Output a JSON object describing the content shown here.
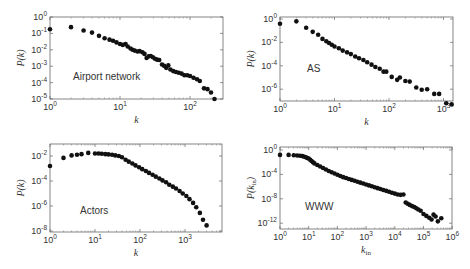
{
  "chart_data": [
    {
      "type": "scatter",
      "title": "Airport network",
      "xlabel": "k",
      "ylabel": "P(k)",
      "xscale": "log",
      "yscale": "log",
      "xlim": [
        1,
        300
      ],
      "ylim": [
        1e-05,
        1
      ],
      "x_ticks": [
        "10^0",
        "10^1",
        "10^2"
      ],
      "y_ticks": [
        "10^0",
        "10^-1",
        "10^-2",
        "10^-3",
        "10^-4",
        "10^-5"
      ],
      "box": {
        "left": 50,
        "top": 17,
        "right": 223,
        "bottom": 99,
        "x_dec": 70,
        "x0": 0,
        "y0": 0,
        "y_dec": 16.4
      },
      "label_pos": [
        73,
        80
      ],
      "log_points": [
        [
          0,
          -0.75
        ],
        [
          0.3,
          -0.62
        ],
        [
          0.48,
          -0.82
        ],
        [
          0.6,
          -0.95
        ],
        [
          0.7,
          -1.15
        ],
        [
          0.78,
          -1.3
        ],
        [
          0.85,
          -1.38
        ],
        [
          0.9,
          -1.45
        ],
        [
          0.95,
          -1.55
        ],
        [
          1.0,
          -1.65
        ],
        [
          1.04,
          -1.7
        ],
        [
          1.08,
          -1.65
        ],
        [
          1.11,
          -1.8
        ],
        [
          1.15,
          -1.92
        ],
        [
          1.18,
          -2.0
        ],
        [
          1.21,
          -2.05
        ],
        [
          1.25,
          -2.1
        ],
        [
          1.28,
          -2.08
        ],
        [
          1.32,
          -2.15
        ],
        [
          1.35,
          -2.25
        ],
        [
          1.38,
          -2.5
        ],
        [
          1.41,
          -2.4
        ],
        [
          1.44,
          -2.38
        ],
        [
          1.47,
          -2.45
        ],
        [
          1.5,
          -2.55
        ],
        [
          1.53,
          -2.6
        ],
        [
          1.56,
          -2.62
        ],
        [
          1.6,
          -2.9
        ],
        [
          1.63,
          -2.98
        ],
        [
          1.66,
          -3.1
        ],
        [
          1.69,
          -2.95
        ],
        [
          1.72,
          -3.2
        ],
        [
          1.76,
          -3.3
        ],
        [
          1.8,
          -3.35
        ],
        [
          1.84,
          -3.4
        ],
        [
          1.88,
          -3.45
        ],
        [
          1.92,
          -3.55
        ],
        [
          1.96,
          -3.55
        ],
        [
          2.0,
          -3.6
        ],
        [
          2.05,
          -3.7
        ],
        [
          2.1,
          -3.8
        ],
        [
          2.14,
          -3.9
        ],
        [
          2.2,
          -4.35
        ],
        [
          2.25,
          -4.4
        ],
        [
          2.3,
          -4.6
        ],
        [
          2.35,
          -5.0
        ]
      ]
    },
    {
      "type": "scatter",
      "title": "AS",
      "xlabel": "k",
      "ylabel": "P(k)",
      "xscale": "log",
      "yscale": "log",
      "xlim": [
        1,
        1500
      ],
      "ylim": [
        1e-07,
        1
      ],
      "x_ticks": [
        "10^0",
        "10^1",
        "10^2",
        "10^3"
      ],
      "y_ticks": [
        "10^0",
        "10^-2",
        "10^-4",
        "10^-6"
      ],
      "box": {
        "left": 280,
        "top": 17,
        "right": 453,
        "bottom": 101,
        "x_dec": 54.5,
        "x0": 0,
        "y0": 0,
        "y_dec": 11.7,
        "y_top": 19
      },
      "label_pos": [
        307,
        72
      ],
      "log_points": [
        [
          0,
          -0.4
        ],
        [
          0.3,
          -0.2
        ],
        [
          0.48,
          -0.75
        ],
        [
          0.6,
          -1.1
        ],
        [
          0.7,
          -1.35
        ],
        [
          0.78,
          -1.7
        ],
        [
          0.85,
          -1.9
        ],
        [
          0.9,
          -2.05
        ],
        [
          0.95,
          -2.2
        ],
        [
          1.0,
          -2.35
        ],
        [
          1.08,
          -2.5
        ],
        [
          1.15,
          -2.7
        ],
        [
          1.23,
          -2.85
        ],
        [
          1.3,
          -3.0
        ],
        [
          1.38,
          -3.2
        ],
        [
          1.45,
          -3.35
        ],
        [
          1.53,
          -3.5
        ],
        [
          1.6,
          -3.7
        ],
        [
          1.68,
          -3.9
        ],
        [
          1.75,
          -4.1
        ],
        [
          1.83,
          -4.25
        ],
        [
          1.9,
          -4.5
        ],
        [
          1.95,
          -4.5
        ],
        [
          2.05,
          -4.95
        ],
        [
          2.15,
          -5.2
        ],
        [
          2.2,
          -5.0
        ],
        [
          2.3,
          -5.3
        ],
        [
          2.38,
          -5.35
        ],
        [
          2.5,
          -5.85
        ],
        [
          2.6,
          -6.05
        ],
        [
          2.7,
          -6.0
        ],
        [
          2.83,
          -6.4
        ],
        [
          2.92,
          -6.4
        ],
        [
          3.05,
          -7.2
        ],
        [
          3.15,
          -7.3
        ]
      ]
    },
    {
      "type": "scatter",
      "title": "Actors",
      "xlabel": "k",
      "ylabel": "P(k)",
      "xscale": "log",
      "yscale": "log",
      "xlim": [
        1,
        7000
      ],
      "ylim": [
        1e-08,
        0.05
      ],
      "x_ticks": [
        "10^0",
        "10^1",
        "10^2",
        "10^3"
      ],
      "y_ticks": [
        "10^-2",
        "10^-4",
        "10^-6",
        "10^-8"
      ],
      "box": {
        "left": 50,
        "top": 144,
        "right": 222,
        "bottom": 232,
        "x_dec": 45,
        "x0": 0,
        "y_ref": -2,
        "y_ref_px": 156,
        "y_dec": 12.5
      },
      "label_pos": [
        80,
        214
      ],
      "log_points": [
        [
          0,
          -2.8
        ],
        [
          0.3,
          -2.15
        ],
        [
          0.48,
          -1.95
        ],
        [
          0.6,
          -1.9
        ],
        [
          0.7,
          -1.85
        ],
        [
          0.85,
          -1.75
        ],
        [
          1.0,
          -1.8
        ],
        [
          1.08,
          -1.8
        ],
        [
          1.15,
          -1.82
        ],
        [
          1.23,
          -1.85
        ],
        [
          1.3,
          -1.87
        ],
        [
          1.38,
          -1.9
        ],
        [
          1.45,
          -1.95
        ],
        [
          1.53,
          -2.0
        ],
        [
          1.6,
          -2.1
        ],
        [
          1.68,
          -2.3
        ],
        [
          1.75,
          -2.45
        ],
        [
          1.83,
          -2.6
        ],
        [
          1.9,
          -2.75
        ],
        [
          1.98,
          -2.9
        ],
        [
          2.05,
          -3.05
        ],
        [
          2.13,
          -3.2
        ],
        [
          2.2,
          -3.35
        ],
        [
          2.28,
          -3.5
        ],
        [
          2.35,
          -3.65
        ],
        [
          2.43,
          -3.8
        ],
        [
          2.5,
          -3.95
        ],
        [
          2.58,
          -4.1
        ],
        [
          2.65,
          -4.3
        ],
        [
          2.73,
          -4.45
        ],
        [
          2.8,
          -4.6
        ],
        [
          2.88,
          -4.8
        ],
        [
          2.95,
          -5.0
        ],
        [
          3.03,
          -5.2
        ],
        [
          3.1,
          -5.45
        ],
        [
          3.18,
          -5.75
        ],
        [
          3.25,
          -6.1
        ],
        [
          3.33,
          -6.55
        ],
        [
          3.4,
          -7.1
        ],
        [
          3.48,
          -7.55
        ]
      ]
    },
    {
      "type": "scatter",
      "title": "WWW",
      "xlabel": "k_in",
      "ylabel": "P(k_in)",
      "xscale": "log",
      "yscale": "log",
      "xlim": [
        1,
        1000000.0
      ],
      "ylim": [
        1e-13,
        1
      ],
      "x_ticks": [
        "10^0",
        "10^1",
        "10^2",
        "10^3",
        "10^4",
        "10^5",
        "10^6"
      ],
      "y_ticks": [
        "10^0",
        "10^-4",
        "10^-8",
        "10^-12"
      ],
      "box": {
        "left": 280,
        "top": 147,
        "right": 452,
        "bottom": 229,
        "x_dec": 28.7,
        "x0": 0,
        "y_ref": 0,
        "y_ref_px": 150,
        "y_dec": 6.1
      },
      "label_pos": [
        305,
        210
      ],
      "log_points": [
        [
          0,
          -0.8
        ],
        [
          0.3,
          -0.8
        ],
        [
          0.48,
          -0.85
        ],
        [
          0.6,
          -0.9
        ],
        [
          0.7,
          -0.95
        ],
        [
          0.78,
          -1.0
        ],
        [
          0.85,
          -1.1
        ],
        [
          0.9,
          -1.2
        ],
        [
          0.95,
          -1.3
        ],
        [
          1.0,
          -1.4
        ],
        [
          1.05,
          -1.6
        ],
        [
          1.1,
          -1.8
        ],
        [
          1.15,
          -2.0
        ],
        [
          1.2,
          -2.2
        ],
        [
          1.3,
          -2.45
        ],
        [
          1.4,
          -2.7
        ],
        [
          1.5,
          -2.95
        ],
        [
          1.6,
          -3.2
        ],
        [
          1.7,
          -3.45
        ],
        [
          1.8,
          -3.65
        ],
        [
          1.9,
          -3.85
        ],
        [
          2.0,
          -4.05
        ],
        [
          2.1,
          -4.25
        ],
        [
          2.2,
          -4.45
        ],
        [
          2.3,
          -4.6
        ],
        [
          2.4,
          -4.75
        ],
        [
          2.5,
          -4.9
        ],
        [
          2.6,
          -5.05
        ],
        [
          2.7,
          -5.2
        ],
        [
          2.8,
          -5.35
        ],
        [
          2.9,
          -5.5
        ],
        [
          3.0,
          -5.65
        ],
        [
          3.1,
          -5.8
        ],
        [
          3.2,
          -5.95
        ],
        [
          3.3,
          -6.1
        ],
        [
          3.4,
          -6.25
        ],
        [
          3.5,
          -6.4
        ],
        [
          3.6,
          -6.55
        ],
        [
          3.7,
          -6.7
        ],
        [
          3.8,
          -6.85
        ],
        [
          3.9,
          -7.0
        ],
        [
          4.0,
          -7.15
        ],
        [
          4.1,
          -7.3
        ],
        [
          4.2,
          -7.35
        ],
        [
          4.3,
          -7.3
        ],
        [
          4.38,
          -8.6
        ],
        [
          4.45,
          -8.8
        ],
        [
          4.52,
          -9.0
        ],
        [
          4.6,
          -9.2
        ],
        [
          4.68,
          -9.35
        ],
        [
          4.75,
          -9.55
        ],
        [
          4.82,
          -9.75
        ],
        [
          4.9,
          -9.95
        ],
        [
          5.0,
          -10.5
        ],
        [
          5.1,
          -10.8
        ],
        [
          5.2,
          -11.1
        ],
        [
          5.28,
          -11.4
        ],
        [
          5.35,
          -10.6
        ],
        [
          5.42,
          -10.9
        ],
        [
          5.5,
          -11.7
        ],
        [
          5.62,
          -11.2
        ]
      ]
    }
  ]
}
